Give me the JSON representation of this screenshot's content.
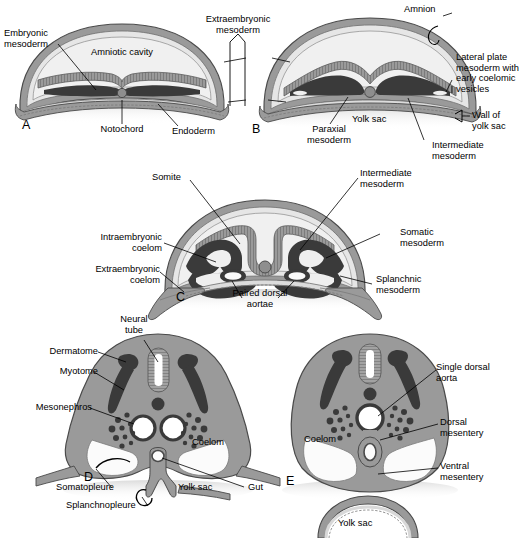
{
  "figure": {
    "type": "anatomical-diagram",
    "panel_count": 5,
    "colors": {
      "background": "#ffffff",
      "ectoderm_amnion_light": "#e9e9e9",
      "cavity_fill": "#ededed",
      "mesoderm_mid_gray": "#8e8e8e",
      "mesoderm_dark": "#3a3a3a",
      "outline": "#4a4a4a",
      "lumen_white": "#ffffff",
      "leader_line": "#000000",
      "text": "#000000"
    }
  },
  "panels": [
    {
      "letter": "A",
      "stage": "Presomite embryo: flat trilaminar disc with amniotic cavity above and yolk sac below",
      "labels": [
        "Embryonic mesoderm",
        "Amniotic cavity",
        "Notochord",
        "Endoderm"
      ]
    },
    {
      "letter": "B",
      "stage": "Mesoderm segregates into paraxial, intermediate and lateral plate; coelomic vesicles appear",
      "labels": [
        "Amnion",
        "Lateral plate mesoderm with early coelomic vesicles",
        "Wall of yolk sac",
        "Intermediate mesoderm",
        "Paraxial mesoderm",
        "Yolk sac"
      ]
    },
    {
      "letter": "C",
      "stage": "Neural groove deepens; somites form; lateral plate splits into somatic and splanchnic layers around the intraembryonic coelom",
      "labels": [
        "Somite",
        "Intermediate mesoderm",
        "Somatic mesoderm",
        "Splanchnic mesoderm",
        "Intraembryonic coelom",
        "Extraembryonic coelom",
        "Paired dorsal aortae"
      ]
    },
    {
      "letter": "D",
      "stage": "Body folding: neural tube closed, somite divided into dermatome and myotome, gut still connected to yolk sac",
      "labels": [
        "Neural tube",
        "Dermatome",
        "Myotome",
        "Mesonephros",
        "Coelom",
        "Somatopleure",
        "Splanchnopleure",
        "Yolk sac",
        "Gut"
      ]
    },
    {
      "letter": "E",
      "stage": "Body wall closed; paired aortae fused into a single dorsal aorta; gut suspended by dorsal and ventral mesenteries",
      "labels": [
        "Single dorsal aorta",
        "Dorsal mesentery",
        "Ventral mesentery",
        "Coelom",
        "Yolk sac"
      ]
    }
  ],
  "labels": {
    "embryonic_mesoderm": "Embryonic\nmesoderm",
    "amniotic_cavity": "Amniotic cavity",
    "notochord": "Notochord",
    "endoderm": "Endoderm",
    "extraembryonic_mesoderm": "Extraembryonic\nmesoderm",
    "amnion": "Amnion",
    "lateral_plate": "Lateral plate\nmesoderm with\nearly coelomic\nvesicles",
    "wall_of_yolk_sac": "Wall of\nyolk sac",
    "intermediate_mesoderm_b": "Intermediate\nmesoderm",
    "paraxial_mesoderm": "Paraxial\nmesoderm",
    "yolk_sac_b": "Yolk sac",
    "somite": "Somite",
    "intermediate_mesoderm_c": "Intermediate\nmesoderm",
    "somatic_mesoderm": "Somatic\nmesoderm",
    "splanchnic_mesoderm": "Splanchnic\nmesoderm",
    "intraembryonic_coelom": "Intraembryonic\ncoelom",
    "extraembryonic_coelom": "Extraembryonic\ncoelom",
    "paired_dorsal_aortae": "Paired dorsal\naortae",
    "neural_tube": "Neural\ntube",
    "dermatome": "Dermatome",
    "myotome": "Myotome",
    "mesonephros": "Mesonephros",
    "coelom_d": "Coelom",
    "somatopleure": "Somatopleure",
    "splanchnopleure": "Splanchnopleure",
    "yolk_sac_d": "Yolk sac",
    "gut": "Gut",
    "single_dorsal_aorta": "Single dorsal\naorta",
    "dorsal_mesentery": "Dorsal\nmesentery",
    "ventral_mesentery": "Ventral\nmesentery",
    "coelom_e": "Coelom",
    "yolk_sac_e": "Yolk sac",
    "panel_a": "A",
    "panel_b": "B",
    "panel_c": "C",
    "panel_d": "D",
    "panel_e": "E"
  }
}
